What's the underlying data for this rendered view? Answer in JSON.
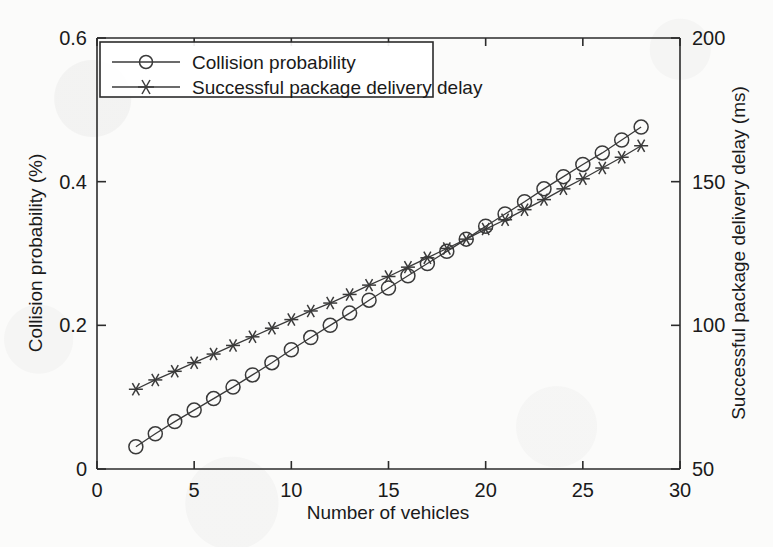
{
  "figure": {
    "background_color": "#fbfbfa",
    "ink_color": "#3a3a3a",
    "axis_color": "#2b2b2b"
  },
  "chart_data": {
    "type": "line",
    "title": "",
    "xlabel": "Number of vehicles",
    "ylabel": "Collision probability (%)",
    "y2label": "Successful package delivery delay (ms)",
    "xlim": [
      0,
      30
    ],
    "ylim": [
      0,
      0.6
    ],
    "y2lim": [
      50,
      200
    ],
    "xticks": [
      0,
      5,
      10,
      15,
      20,
      25,
      30
    ],
    "xtick_labels": [
      "0",
      "5",
      "10",
      "15",
      "20",
      "25",
      "30"
    ],
    "yticks": [
      0,
      0.2,
      0.4,
      0.6
    ],
    "ytick_labels": [
      "0",
      "0.2",
      "0.4",
      "0.6"
    ],
    "y2ticks": [
      50,
      100,
      150,
      200
    ],
    "y2tick_labels": [
      "50",
      "100",
      "150",
      "200"
    ],
    "grid": false,
    "legend_position": "upper left",
    "x": [
      2,
      3,
      4,
      5,
      6,
      7,
      8,
      9,
      10,
      11,
      12,
      13,
      14,
      15,
      16,
      17,
      18,
      19,
      20,
      21,
      22,
      23,
      24,
      25,
      26,
      27,
      28
    ],
    "series": [
      {
        "name": "Collision probability",
        "axis": "left",
        "marker": "circle",
        "unit": "%",
        "values": [
          0.031,
          0.049,
          0.066,
          0.082,
          0.098,
          0.114,
          0.131,
          0.148,
          0.166,
          0.183,
          0.2,
          0.217,
          0.235,
          0.252,
          0.269,
          0.286,
          0.303,
          0.32,
          0.338,
          0.355,
          0.372,
          0.39,
          0.407,
          0.424,
          0.44,
          0.458,
          0.476
        ]
      },
      {
        "name": "Successful package delivery delay",
        "axis": "right",
        "marker": "star",
        "unit": "ms",
        "values_left_scale": [
          0.111,
          0.124,
          0.136,
          0.148,
          0.16,
          0.172,
          0.184,
          0.196,
          0.208,
          0.22,
          0.231,
          0.243,
          0.256,
          0.268,
          0.281,
          0.294,
          0.307,
          0.32,
          0.334,
          0.347,
          0.361,
          0.375,
          0.39,
          0.404,
          0.419,
          0.434,
          0.45
        ],
        "values": [
          77.8,
          81.0,
          84.0,
          87.0,
          90.0,
          93.0,
          96.0,
          99.0,
          102.0,
          105.0,
          107.8,
          110.8,
          114.0,
          117.0,
          120.3,
          123.5,
          126.8,
          130.0,
          133.5,
          136.8,
          140.3,
          143.8,
          147.5,
          151.0,
          154.8,
          158.5,
          162.5
        ]
      }
    ]
  },
  "legend": {
    "entries": [
      {
        "label": "Collision probability",
        "marker": "circle"
      },
      {
        "label": "Successful package delivery delay",
        "marker": "star"
      }
    ]
  }
}
